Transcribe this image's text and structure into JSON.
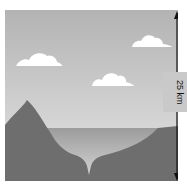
{
  "diagram": {
    "title": "",
    "scale_label": "25 km",
    "elements": [
      "sky",
      "clouds",
      "mountain",
      "sea",
      "trench",
      "ocean-floor",
      "height-arrow"
    ]
  },
  "colors": {
    "sky_top": "#b5b5b5",
    "sky_bottom": "#e4e4e4",
    "cloud": "#ffffff",
    "land": "#6e6e6e",
    "water": "#a8a8a8",
    "arrow": "#111111"
  }
}
